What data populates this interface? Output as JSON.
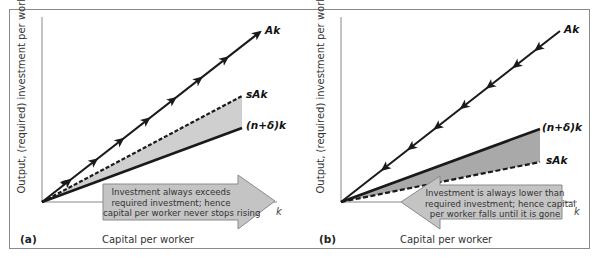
{
  "figure": {
    "colors": {
      "frame": "#8a8a8a",
      "line": "#1a1a1a",
      "axis": "#888888",
      "shade_a": "#cfcfcf",
      "shade_b": "#a9a9a9",
      "arrow_fill": "#c4c4c4",
      "arrow_stroke": "#8a8a8a"
    }
  },
  "panels": [
    {
      "id": "a",
      "label": "(a)",
      "ylabel": "Output, (required) investment per worker",
      "xlabel": "Capital per worker",
      "x_axis_symbol": "k",
      "curves": {
        "ak": "Ak",
        "sak": "sAk",
        "ndk": "(n+δ)k"
      },
      "arrow_text": [
        "Investment always exceeds",
        "required investment; hence",
        "capital per worker never stops rising"
      ],
      "arrow_direction": "right"
    },
    {
      "id": "b",
      "label": "(b)",
      "ylabel": "Output, (required) investment per worker",
      "xlabel": "Capital per worker",
      "x_axis_symbol": "k",
      "curves": {
        "ak": "Ak",
        "ndk": "(n+δ)k",
        "sak": "sAk"
      },
      "arrow_text": [
        "Investment is always lower than",
        "required investment; hence capital",
        "per worker falls until it is gone"
      ],
      "arrow_direction": "left"
    }
  ],
  "chart_data": [
    {
      "type": "line",
      "title": "(a)",
      "xlabel": "Capital per worker",
      "ylabel": "Output, (required) investment per worker",
      "series": [
        {
          "name": "Ak",
          "style": "solid with forward arrows",
          "slope_relative": 0.78
        },
        {
          "name": "sAk",
          "style": "dashed",
          "slope_relative": 0.53
        },
        {
          "name": "(n+δ)k",
          "style": "solid",
          "slope_relative": 0.37
        }
      ],
      "shaded_region": "between sAk (above) and (n+δ)k (below)",
      "annotation": "Investment always exceeds required investment; hence capital per worker never stops rising"
    },
    {
      "type": "line",
      "title": "(b)",
      "xlabel": "Capital per worker",
      "ylabel": "Output, (required) investment per worker",
      "series": [
        {
          "name": "Ak",
          "style": "solid with backward arrows",
          "slope_relative": 0.78
        },
        {
          "name": "(n+δ)k",
          "style": "solid",
          "slope_relative": 0.37
        },
        {
          "name": "sAk",
          "style": "dashed",
          "slope_relative": 0.2
        }
      ],
      "shaded_region": "between (n+δ)k (above) and sAk (below)",
      "annotation": "Investment is always lower than required investment; hence capital per worker falls until it is gone"
    }
  ]
}
